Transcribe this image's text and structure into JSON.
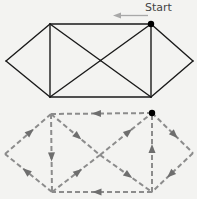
{
  "diagram": {
    "start_label": "Start",
    "colors": {
      "background": "#f3f3f1",
      "solid_edge": "#1a1a1a",
      "dashed_edge": "#8c8c8c",
      "arrow": "#6e6e6e",
      "start_arrow": "#a8a8a8",
      "start_vertex": "#000000"
    },
    "vertices": [
      "left",
      "top-left",
      "top-right",
      "right",
      "bottom-left",
      "bottom-right",
      "center"
    ],
    "edges": [
      [
        "left",
        "top-left"
      ],
      [
        "left",
        "bottom-left"
      ],
      [
        "top-left",
        "top-right"
      ],
      [
        "bottom-left",
        "bottom-right"
      ],
      [
        "top-left",
        "bottom-left"
      ],
      [
        "top-right",
        "bottom-right"
      ],
      [
        "top-left",
        "center"
      ],
      [
        "center",
        "bottom-right"
      ],
      [
        "bottom-left",
        "center"
      ],
      [
        "center",
        "top-right"
      ],
      [
        "top-right",
        "right"
      ],
      [
        "right",
        "bottom-right"
      ]
    ],
    "start_vertex": "top-right",
    "euler_path_directed_edges": [
      [
        "top-right",
        "top-left"
      ],
      [
        "top-left",
        "center"
      ],
      [
        "center",
        "bottom-right"
      ],
      [
        "bottom-right",
        "top-right"
      ],
      [
        "top-right",
        "right"
      ],
      [
        "right",
        "bottom-right"
      ],
      [
        "bottom-right",
        "bottom-left"
      ],
      [
        "bottom-left",
        "left"
      ],
      [
        "left",
        "top-left"
      ],
      [
        "top-left",
        "bottom-left"
      ],
      [
        "bottom-left",
        "center"
      ],
      [
        "center",
        "top-right"
      ]
    ]
  }
}
